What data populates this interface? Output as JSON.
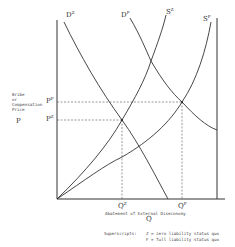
{
  "diagram": {
    "y_axis": {
      "title_lines": [
        "Bribe",
        "or",
        "Compensation",
        "Price"
      ],
      "symbol": "P",
      "ticks": [
        {
          "base": "P",
          "sup": "F",
          "y": 102
        },
        {
          "base": "P",
          "sup": "Z",
          "y": 120
        }
      ]
    },
    "x_axis": {
      "title": "Abatement of External Diseconomy",
      "symbol": "Q",
      "ticks": [
        {
          "base": "Q",
          "sup": "Z",
          "x": 122
        },
        {
          "base": "Q",
          "sup": "F",
          "x": 182
        }
      ]
    },
    "curves": [
      {
        "base": "D",
        "sup": "Z",
        "type": "demand",
        "label_x": 66,
        "label_y": 16
      },
      {
        "base": "D",
        "sup": "F",
        "type": "demand",
        "label_x": 121,
        "label_y": 16
      },
      {
        "base": "S",
        "sup": "Z",
        "type": "supply",
        "label_x": 165,
        "label_y": 13
      },
      {
        "base": "S",
        "sup": "F",
        "type": "supply",
        "label_x": 203,
        "label_y": 20
      }
    ],
    "equilibria": [
      {
        "name": "zero-liability",
        "q": "QZ",
        "p": "PZ",
        "x": 122,
        "y": 120
      },
      {
        "name": "full-liability",
        "q": "QF",
        "p": "PF",
        "x": 182,
        "y": 102
      }
    ],
    "legend": {
      "heading": "Superscripts:",
      "lines": [
        "Z = zero liability status quo",
        "F = full liability status quo"
      ]
    }
  }
}
